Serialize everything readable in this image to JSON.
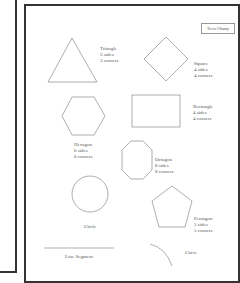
{
  "header": {
    "name_box": "Trevo Obamy"
  },
  "shapes": [
    {
      "name": "Triangle",
      "sides": "3 sides",
      "corners": "3 corners"
    },
    {
      "name": "Square",
      "sides": "4 sides",
      "corners": "4 corners"
    },
    {
      "name": "Rectangle",
      "sides": "4 sides",
      "corners": "4 corners"
    },
    {
      "name": "Hexagon",
      "sides": "6 sides",
      "corners": "6 corners"
    },
    {
      "name": "Octagon",
      "sides": "8 sides",
      "corners": "8 corners"
    },
    {
      "name": "Circle"
    },
    {
      "name": "Pentagon",
      "sides": "5 sides",
      "corners": "5 corners"
    },
    {
      "name": "Line Segment"
    },
    {
      "name": "Curve"
    }
  ]
}
